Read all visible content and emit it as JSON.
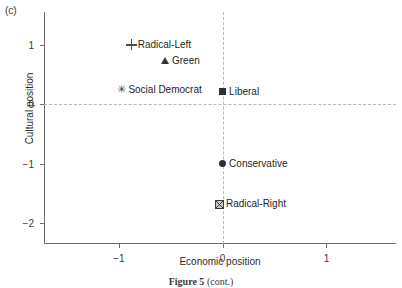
{
  "panel": {
    "label": "(c)"
  },
  "caption": {
    "bold_part": "Figure 5",
    "rest_part": " (cont.)"
  },
  "chart_data": {
    "type": "scatter",
    "title": "",
    "xlabel": "Economic position",
    "ylabel": "Cultural position",
    "xlim": [
      -1.72,
      1.67
    ],
    "ylim": [
      -2.35,
      1.55
    ],
    "xticks": [
      -1,
      0,
      1
    ],
    "xticklabels": [
      "−1",
      "0",
      "1"
    ],
    "yticks": [
      1,
      0,
      -1,
      -2
    ],
    "yticklabels": [
      "1",
      "0",
      "−1",
      "−2"
    ],
    "grid": true,
    "gridlines": {
      "vertical_at_x": 0,
      "horizontal_at_y": 0,
      "style": "dashed",
      "color": "#b9b9b9"
    },
    "legend": "none",
    "label_position": "right-of-marker",
    "points": [
      {
        "name": "Radical-Left",
        "x": -0.88,
        "y": 1.0,
        "marker": "plus",
        "marker_icon": "plus-marker-icon"
      },
      {
        "name": "Green",
        "x": -0.55,
        "y": 0.73,
        "marker": "triangle",
        "marker_icon": "triangle-marker-icon"
      },
      {
        "name": "Social Democrat",
        "x": -0.97,
        "y": 0.25,
        "marker": "asterisk",
        "marker_icon": "asterisk-marker-icon"
      },
      {
        "name": "Liberal",
        "x": 0.0,
        "y": 0.22,
        "marker": "square",
        "marker_icon": "square-marker-icon"
      },
      {
        "name": "Conservative",
        "x": 0.0,
        "y": -1.0,
        "marker": "circle",
        "marker_icon": "circle-marker-icon"
      },
      {
        "name": "Radical-Right",
        "x": -0.03,
        "y": -1.67,
        "marker": "boxcross",
        "marker_icon": "boxed-cross-marker-icon"
      }
    ]
  }
}
